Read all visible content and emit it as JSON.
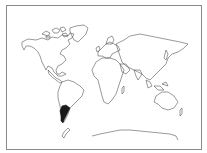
{
  "map": {
    "type": "outline-world-map",
    "highlighted_region": "Argentina (southern South America)",
    "colors": {
      "outline": "#555555",
      "highlight": "#1a1a1a",
      "background": "#ffffff",
      "frame": "#8a8a8a"
    },
    "regions": [
      "North America",
      "Greenland",
      "South America",
      "Europe",
      "Africa",
      "Asia",
      "Australia",
      "New Zealand",
      "Antarctica"
    ]
  }
}
